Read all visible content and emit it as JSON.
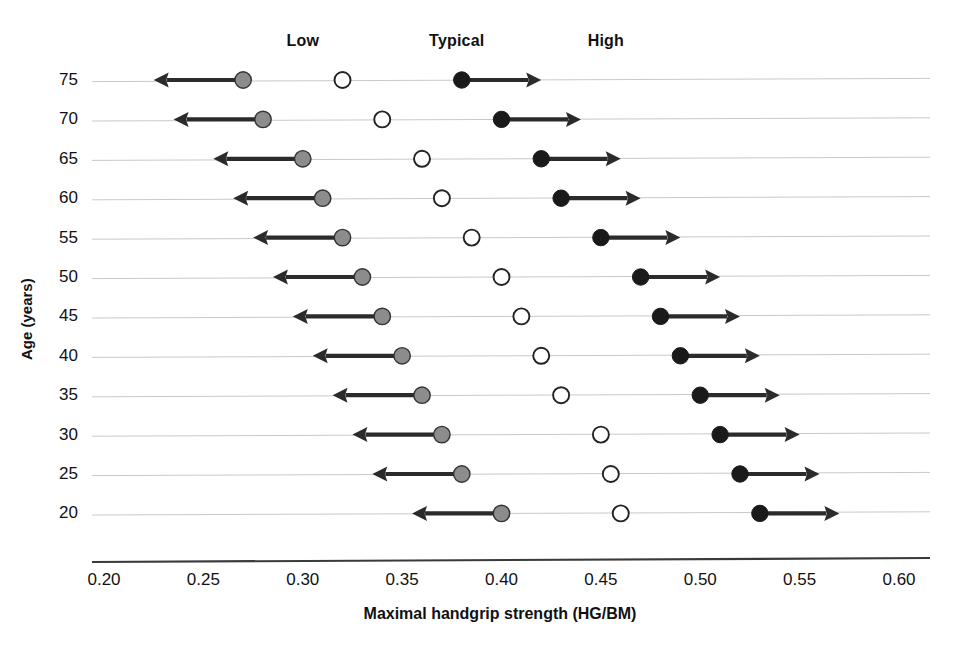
{
  "chart_data": {
    "type": "scatter",
    "title": "",
    "xlabel": "Maximal handgrip strength (HG/BM)",
    "ylabel": "Age (years)",
    "xlim": [
      0.2,
      0.6
    ],
    "xticks": [
      "0.20",
      "0.25",
      "0.30",
      "0.35",
      "0.40",
      "0.45",
      "0.50",
      "0.55",
      "0.60"
    ],
    "xtick_values": [
      0.2,
      0.25,
      0.3,
      0.35,
      0.4,
      0.45,
      0.5,
      0.55,
      0.6
    ],
    "categories": [
      75,
      70,
      65,
      60,
      55,
      50,
      45,
      40,
      35,
      30,
      25,
      20
    ],
    "ytick_labels": [
      "75",
      "70",
      "65",
      "60",
      "55",
      "50",
      "45",
      "40",
      "35",
      "30",
      "25",
      "20"
    ],
    "grid": true,
    "legend_position": "top",
    "group_labels": [
      {
        "name": "Low",
        "value": 0.3,
        "marker": "grey-filled-circle",
        "arrow": "left"
      },
      {
        "name": "Typical",
        "value": 0.3775,
        "marker": "open-circle",
        "arrow": "none"
      },
      {
        "name": "High",
        "value": 0.4525,
        "marker": "black-filled-circle",
        "arrow": "right"
      }
    ],
    "series": [
      {
        "name": "Low",
        "marker": "grey-filled-circle",
        "arrow_direction": "left",
        "arrow_length": 0.045,
        "values": [
          0.27,
          0.28,
          0.3,
          0.31,
          0.32,
          0.33,
          0.34,
          0.35,
          0.36,
          0.37,
          0.38,
          0.4
        ]
      },
      {
        "name": "Typical",
        "marker": "open-circle",
        "arrow_direction": "none",
        "arrow_length": 0,
        "values": [
          0.32,
          0.34,
          0.36,
          0.37,
          0.385,
          0.4,
          0.41,
          0.42,
          0.43,
          0.45,
          0.455,
          0.46
        ]
      },
      {
        "name": "High",
        "marker": "black-filled-circle",
        "arrow_direction": "right",
        "arrow_length": 0.04,
        "values": [
          0.38,
          0.4,
          0.42,
          0.43,
          0.45,
          0.47,
          0.48,
          0.49,
          0.5,
          0.51,
          0.52,
          0.53
        ]
      }
    ],
    "colors": {
      "low_marker": "#8c8c8c",
      "typical_marker": "#ffffff",
      "high_marker": "#1a1a1a",
      "marker_stroke": "#333333",
      "arrow": "#2b2b2b",
      "gridline": "#c9c9c9",
      "axis": "#3a3a3a",
      "text": "#111111"
    }
  },
  "axis": {
    "x_label": "Maximal handgrip strength (HG/BM)",
    "y_label": "Age (years)"
  }
}
